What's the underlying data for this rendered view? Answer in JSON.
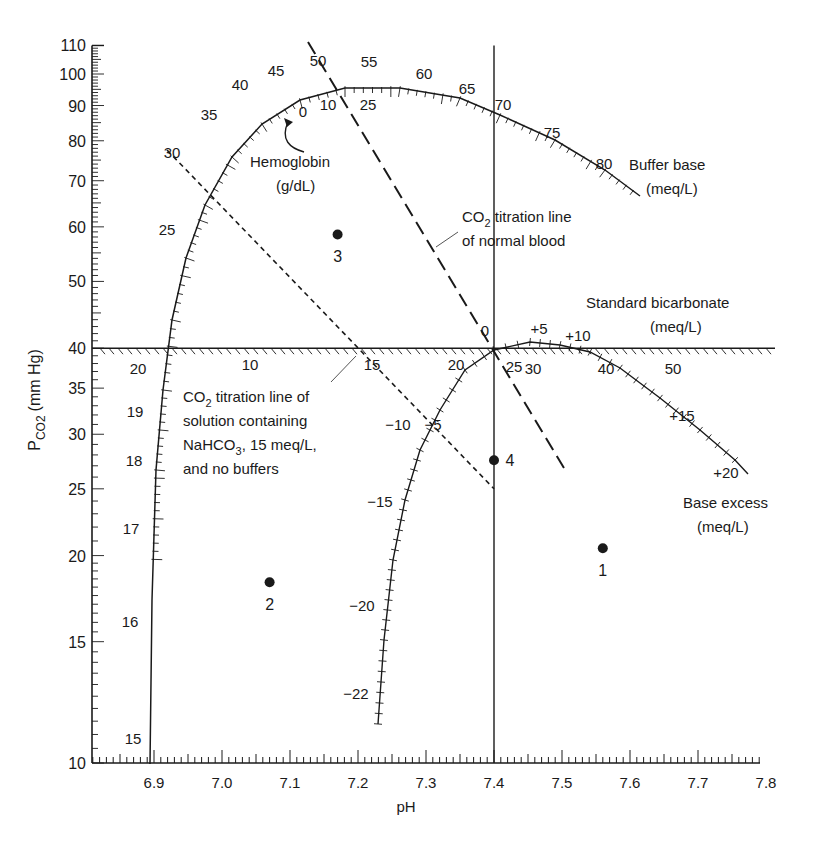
{
  "chart_data": {
    "type": "scatter",
    "xlabel": "pH",
    "ylabel": "PCO2 (mm Hg)",
    "ylabel_main": "P",
    "ylabel_sub": "CO2",
    "ylabel_unit": "(mm Hg)",
    "xlim": [
      6.8,
      7.8
    ],
    "ylim": [
      10,
      110
    ],
    "yscale": "log",
    "x_ticks": [
      "6.9",
      "7.0",
      "7.1",
      "7.2",
      "7.3",
      "7.4",
      "7.5",
      "7.6",
      "7.7",
      "7.8"
    ],
    "y_ticks": [
      "10",
      "15",
      "20",
      "25",
      "30",
      "35",
      "40",
      "50",
      "60",
      "70",
      "80",
      "90",
      "100",
      "110"
    ],
    "points": [
      {
        "label": "1",
        "pH": 7.56,
        "pco2": 20.5
      },
      {
        "label": "2",
        "pH": 7.07,
        "pco2": 18.3
      },
      {
        "label": "3",
        "pH": 7.17,
        "pco2": 58.5
      },
      {
        "label": "4",
        "pH": 7.4,
        "pco2": 27.5
      }
    ],
    "lines": {
      "pco2_40_line": {
        "pco2": 40,
        "from_pH": 6.8,
        "to_pH": 7.8
      },
      "ph_74_line": {
        "pH": 7.4,
        "from_pco2": 10,
        "to_pco2": 110
      },
      "normal_blood_titration": {
        "points": [
          [
            7.14,
            110
          ],
          [
            7.5,
            26.5
          ]
        ],
        "style": "long-dash"
      },
      "bicarbonate_solution_titration": {
        "points": [
          [
            6.93,
            77
          ],
          [
            7.4,
            25
          ]
        ],
        "style": "short-dash"
      }
    },
    "scales": {
      "buffer_base": {
        "name": "Buffer base",
        "unit": "(meq/L)",
        "labels": [
          "25",
          "30",
          "35",
          "40",
          "45",
          "50",
          "55",
          "60",
          "65",
          "70",
          "75",
          "80"
        ]
      },
      "hemoglobin": {
        "name": "Hemoglobin",
        "unit": "(g/dL)",
        "labels": [
          "0",
          "10",
          "25"
        ]
      },
      "standard_bicarbonate": {
        "name": "Standard bicarbonate",
        "unit": "(meq/L)",
        "labels": [
          "10",
          "15",
          "20",
          "25",
          "30",
          "40",
          "50"
        ]
      },
      "base_excess": {
        "name": "Base excess",
        "unit": "(meq/L)",
        "labels": [
          "-22",
          "-20",
          "-15",
          "-10",
          "-5",
          "0",
          "+5",
          "+10",
          "+15",
          "+20"
        ]
      },
      "left_curve": {
        "labels": [
          "20",
          "19",
          "18",
          "17",
          "16",
          "15"
        ]
      }
    },
    "annotations": {
      "hemoglobin": "Hemoglobin",
      "hemoglobin_unit": "(g/dL)",
      "buffer_base": "Buffer base",
      "buffer_base_unit": "(meq/L)",
      "normal_blood_1": "CO",
      "normal_blood_1_sub": "2",
      "normal_blood_1_rest": " titration line",
      "normal_blood_2": "of normal blood",
      "std_bicarb": "Standard bicarbonate",
      "std_bicarb_unit": "(meq/L)",
      "solution_1": "CO",
      "solution_1_sub": "2",
      "solution_1_rest": " titration line of",
      "solution_2": "solution containing",
      "solution_3": "NaHCO",
      "solution_3_sub": "3",
      "solution_3_rest": ", 15 meq/L,",
      "solution_4": "and no buffers",
      "base_excess": "Base excess",
      "base_excess_unit": "(meq/L)"
    }
  }
}
